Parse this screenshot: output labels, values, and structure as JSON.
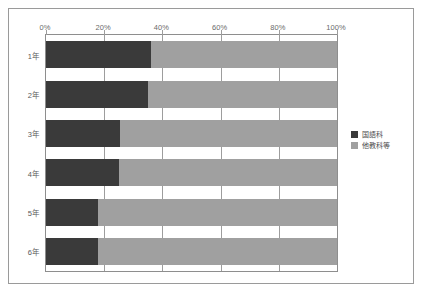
{
  "chart_data": {
    "type": "bar",
    "orientation": "horizontal",
    "stacked": true,
    "title": "",
    "xlabel": "",
    "ylabel": "",
    "xlim": [
      0,
      100
    ],
    "grid": true,
    "legend_position": "right",
    "categories": [
      "1年",
      "2年",
      "3年",
      "4年",
      "5年",
      "6年"
    ],
    "tick_labels": [
      "0%",
      "20%",
      "40%",
      "60%",
      "80%",
      "100%"
    ],
    "tick_values": [
      0,
      20,
      40,
      60,
      80,
      100
    ],
    "series": [
      {
        "name": "国語科",
        "color": "#3a3a3a",
        "values": [
          36,
          35,
          25.5,
          25,
          18,
          18
        ]
      },
      {
        "name": "他教科等",
        "color": "#a0a0a0",
        "values": [
          64,
          65,
          74.5,
          75,
          82,
          82
        ]
      }
    ]
  },
  "legend": {
    "items": [
      {
        "label": "国語科",
        "color": "#3a3a3a"
      },
      {
        "label": "他教科等",
        "color": "#a0a0a0"
      }
    ]
  },
  "colors": {
    "series_primary": "#3a3a3a",
    "series_secondary": "#a0a0a0",
    "frame_border": "#9a9a9a",
    "plot_border": "#8e8e8e",
    "gridline": "#9d9d9d",
    "background": "#ffffff"
  }
}
